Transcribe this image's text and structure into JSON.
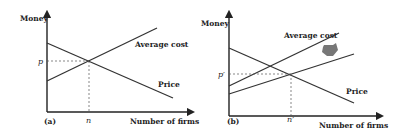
{
  "panel_a": {
    "label": "(a)",
    "y_axis_label": "Money",
    "x_axis_label": "Number of firms",
    "price_label": "Price",
    "avg_cost_label": "Average cost",
    "equilibrium_price": "p",
    "equilibrium_firms": "n"
  },
  "panel_b": {
    "label": "(b)",
    "y_axis_label": "Money",
    "x_axis_label": "Number of firms",
    "price_label": "Price",
    "avg_cost_label": "Average cost",
    "equilibrium_price": "p′",
    "equilibrium_firms": "n′",
    "shift_arrow": "down-arrow-icon"
  },
  "colors": {
    "line": "#333333",
    "arrow": "#777777",
    "background": "#ffffff"
  }
}
